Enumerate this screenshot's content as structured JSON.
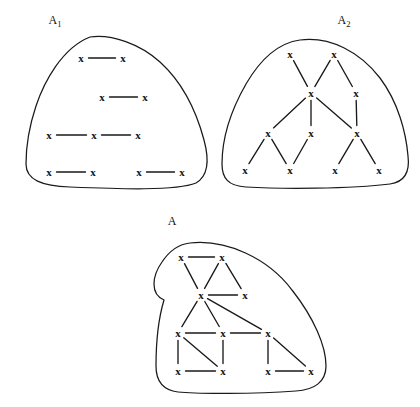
{
  "figure": {
    "stroke_color": "#1a1a1a",
    "background_color": "#ffffff",
    "node_glyph": "x"
  },
  "chart_data": {
    "type": "diagram",
    "grid": false,
    "legend": "none",
    "xlim": [
      0,
      420
    ],
    "ylim": [
      0,
      407
    ],
    "panels": [
      {
        "id": "A1",
        "label": "A",
        "label_subscript": "1",
        "label_x": 55,
        "label_y": 20,
        "outline": "M 90 37 C 112 34 140 44 160 62 C 182 82 196 110 204 140 C 210 162 208 176 196 183 C 176 191 120 189 70 187 C 42 186 26 180 26 164 C 26 142 30 124 36 106 C 44 82 62 48 90 37 Z",
        "nodes": [
          {
            "id": "a1",
            "x": 81,
            "y": 58
          },
          {
            "id": "a2",
            "x": 123,
            "y": 58
          },
          {
            "id": "a3",
            "x": 102,
            "y": 97
          },
          {
            "id": "a4",
            "x": 145,
            "y": 97
          },
          {
            "id": "a5",
            "x": 49,
            "y": 135
          },
          {
            "id": "a6",
            "x": 94,
            "y": 135
          },
          {
            "id": "a7",
            "x": 138,
            "y": 135
          },
          {
            "id": "a8",
            "x": 49,
            "y": 172
          },
          {
            "id": "a9",
            "x": 93,
            "y": 172
          },
          {
            "id": "a10",
            "x": 139,
            "y": 172
          },
          {
            "id": "a11",
            "x": 182,
            "y": 172
          }
        ],
        "edges": [
          [
            "a1",
            "a2"
          ],
          [
            "a3",
            "a4"
          ],
          [
            "a5",
            "a6"
          ],
          [
            "a6",
            "a7"
          ],
          [
            "a8",
            "a9"
          ],
          [
            "a10",
            "a11"
          ]
        ]
      },
      {
        "id": "A2",
        "label": "A",
        "label_subscript": "2",
        "label_x": 344,
        "label_y": 20,
        "outline": "M 300 40 C 330 36 360 52 380 78 C 398 102 406 132 408 156 C 410 172 404 182 390 184 C 350 189 280 189 246 187 C 228 186 222 178 222 164 C 222 140 230 112 246 84 C 260 60 278 43 300 40 Z",
        "nodes": [
          {
            "id": "b1",
            "x": 290,
            "y": 54
          },
          {
            "id": "b2",
            "x": 334,
            "y": 54
          },
          {
            "id": "b3",
            "x": 311,
            "y": 93
          },
          {
            "id": "b4",
            "x": 356,
            "y": 93
          },
          {
            "id": "b5",
            "x": 268,
            "y": 133
          },
          {
            "id": "b6",
            "x": 311,
            "y": 133
          },
          {
            "id": "b7",
            "x": 357,
            "y": 133
          },
          {
            "id": "b8",
            "x": 245,
            "y": 170
          },
          {
            "id": "b9",
            "x": 290,
            "y": 170
          },
          {
            "id": "b10",
            "x": 335,
            "y": 170
          },
          {
            "id": "b11",
            "x": 379,
            "y": 170
          }
        ],
        "edges": [
          [
            "b1",
            "b3"
          ],
          [
            "b2",
            "b3"
          ],
          [
            "b2",
            "b4"
          ],
          [
            "b3",
            "b5"
          ],
          [
            "b3",
            "b6"
          ],
          [
            "b3",
            "b7"
          ],
          [
            "b4",
            "b7"
          ],
          [
            "b5",
            "b8"
          ],
          [
            "b5",
            "b9"
          ],
          [
            "b6",
            "b9"
          ],
          [
            "b7",
            "b10"
          ],
          [
            "b7",
            "b11"
          ]
        ]
      },
      {
        "id": "A",
        "label": "A",
        "label_subscript": "",
        "label_x": 172,
        "label_y": 221,
        "outline": "M 190 243 C 226 239 268 258 292 290 C 314 318 326 346 326 366 C 326 382 314 390 296 391 C 254 394 196 394 178 392 C 162 390 156 380 156 366 C 156 344 158 320 164 300 C 150 294 152 276 162 262 C 170 250 180 244 190 243 Z",
        "nodes": [
          {
            "id": "c1",
            "x": 181,
            "y": 257
          },
          {
            "id": "c2",
            "x": 222,
            "y": 257
          },
          {
            "id": "c3",
            "x": 201,
            "y": 295
          },
          {
            "id": "c4",
            "x": 245,
            "y": 295
          },
          {
            "id": "c5",
            "x": 178,
            "y": 333
          },
          {
            "id": "c6",
            "x": 223,
            "y": 333
          },
          {
            "id": "c7",
            "x": 268,
            "y": 333
          },
          {
            "id": "c8",
            "x": 178,
            "y": 371
          },
          {
            "id": "c9",
            "x": 223,
            "y": 371
          },
          {
            "id": "c10",
            "x": 268,
            "y": 371
          },
          {
            "id": "c11",
            "x": 311,
            "y": 371
          }
        ],
        "edges": [
          [
            "c1",
            "c2"
          ],
          [
            "c1",
            "c3"
          ],
          [
            "c2",
            "c3"
          ],
          [
            "c2",
            "c4"
          ],
          [
            "c3",
            "c4"
          ],
          [
            "c3",
            "c5"
          ],
          [
            "c3",
            "c6"
          ],
          [
            "c3",
            "c7"
          ],
          [
            "c5",
            "c6"
          ],
          [
            "c6",
            "c7"
          ],
          [
            "c5",
            "c8"
          ],
          [
            "c5",
            "c9"
          ],
          [
            "c6",
            "c9"
          ],
          [
            "c8",
            "c9"
          ],
          [
            "c7",
            "c10"
          ],
          [
            "c7",
            "c11"
          ],
          [
            "c10",
            "c11"
          ]
        ]
      }
    ]
  }
}
